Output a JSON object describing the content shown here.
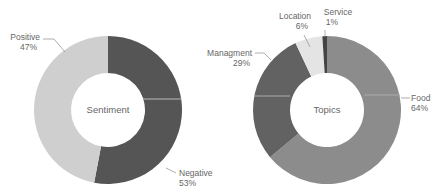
{
  "chart_data": [
    {
      "type": "pie",
      "variant": "donut",
      "title": "Sentiment",
      "categories": [
        "Negative",
        "Positive"
      ],
      "values": [
        53,
        47
      ],
      "labels": [
        "53%",
        "47%"
      ],
      "colors": [
        "#555555",
        "#cfcfcf"
      ]
    },
    {
      "type": "pie",
      "variant": "donut",
      "title": "Topics",
      "categories": [
        "Food",
        "Managment",
        "Location",
        "Service"
      ],
      "values": [
        64,
        29,
        6,
        1
      ],
      "labels": [
        "64%",
        "29%",
        "6%",
        "1%"
      ],
      "colors": [
        "#8c8c8c",
        "#626262",
        "#e4e4e4",
        "#444444"
      ]
    }
  ],
  "sentiment": {
    "center": "Sentiment",
    "positive": {
      "name": "Positive",
      "pct": "47%"
    },
    "negative": {
      "name": "Negative",
      "pct": "53%"
    }
  },
  "topics": {
    "center": "Topics",
    "food": {
      "name": "Food",
      "pct": "64%"
    },
    "managment": {
      "name": "Managment",
      "pct": "29%"
    },
    "location": {
      "name": "Location",
      "pct": "6%"
    },
    "service": {
      "name": "Service",
      "pct": "1%"
    }
  }
}
